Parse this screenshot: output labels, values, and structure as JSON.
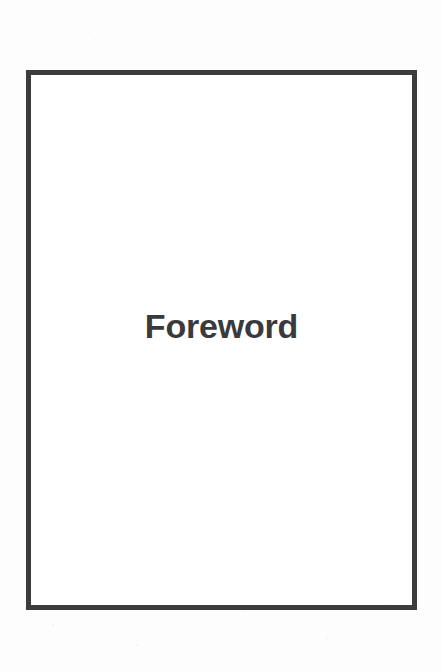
{
  "page": {
    "kind": "book-section-divider",
    "background_color": "#fdfdfd",
    "paper_color": "#ffffff"
  },
  "frame": {
    "border_color": "#3c3c3e",
    "border_width_px": 5,
    "left_px": 26,
    "top_px": 70,
    "width_px": 391,
    "height_px": 540
  },
  "content": {
    "section_title": "Foreword",
    "title_color": "#3a3a3c",
    "title_font_size_px": 34,
    "title_weight": "bold",
    "title_align": "center"
  }
}
